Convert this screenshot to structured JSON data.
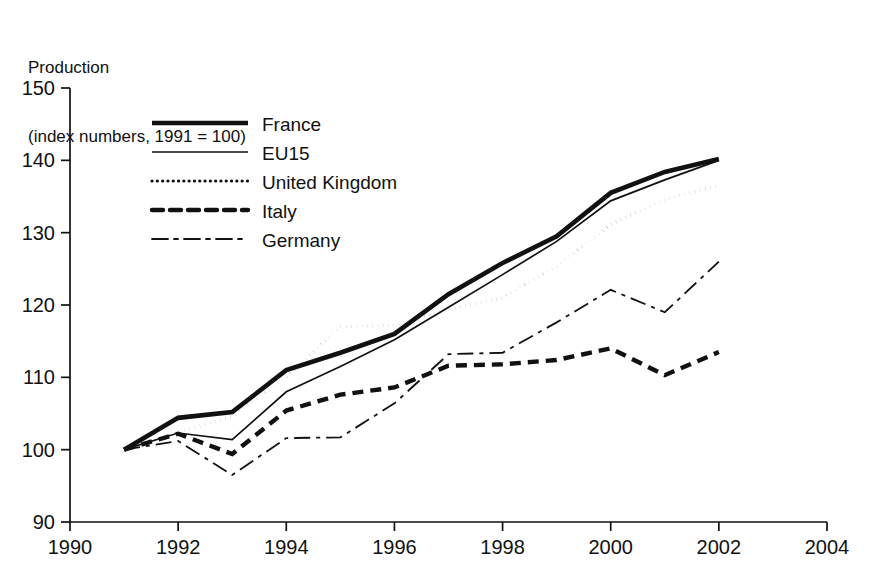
{
  "title": {
    "line1": "Production",
    "line2": "(index numbers, 1991 = 100)"
  },
  "chart_data": {
    "type": "line",
    "title": "Production (index numbers, 1991 = 100)",
    "xlabel": "",
    "ylabel": "Production (index numbers, 1991 = 100)",
    "xlim": [
      1990,
      2004
    ],
    "ylim": [
      90,
      150
    ],
    "xticks": [
      1990,
      1992,
      1994,
      1996,
      1998,
      2000,
      2002,
      2004
    ],
    "yticks": [
      90,
      100,
      110,
      120,
      130,
      140,
      150
    ],
    "xtick_labels": [
      "1990",
      "1992",
      "1994",
      "1996",
      "1998",
      "2000",
      "2002",
      "2004"
    ],
    "ytick_labels": [
      "90",
      "100",
      "110",
      "120",
      "130",
      "140",
      "150"
    ],
    "grid": false,
    "legend_position": "upper-left-inside",
    "x": [
      1991,
      1992,
      1993,
      1994,
      1995,
      1996,
      1997,
      1998,
      1999,
      2000,
      2001,
      2002
    ],
    "series": [
      {
        "name": "France",
        "style": "solid-thick",
        "color": "#111111",
        "values": [
          100.0,
          104.4,
          105.2,
          111.0,
          113.4,
          116.0,
          121.5,
          125.8,
          129.5,
          135.5,
          138.4,
          140.2
        ]
      },
      {
        "name": "EU15",
        "style": "solid-thin",
        "color": "#111111",
        "values": [
          100.0,
          102.3,
          101.4,
          108.0,
          111.5,
          115.2,
          119.7,
          124.2,
          128.8,
          134.4,
          137.3,
          140.0
        ]
      },
      {
        "name": "United Kingdom",
        "style": "dotted",
        "color": "#111111",
        "values": [
          100.0,
          102.4,
          104.6,
          110.1,
          117.0,
          117.2,
          119.4,
          121.0,
          125.4,
          131.1,
          134.6,
          136.5
        ]
      },
      {
        "name": "Italy",
        "style": "dashed-thick",
        "color": "#111111",
        "values": [
          100.0,
          102.2,
          99.4,
          105.4,
          107.6,
          108.6,
          111.6,
          111.8,
          112.4,
          114.0,
          110.3,
          113.5
        ]
      },
      {
        "name": "Germany",
        "style": "dash-dot",
        "color": "#111111",
        "values": [
          100.0,
          101.2,
          96.5,
          101.6,
          101.7,
          106.4,
          113.2,
          113.4,
          117.6,
          122.1,
          119.0,
          126.0
        ]
      }
    ]
  },
  "legend": {
    "items": [
      {
        "label": "France"
      },
      {
        "label": "EU15"
      },
      {
        "label": "United Kingdom"
      },
      {
        "label": "Italy"
      },
      {
        "label": "Germany"
      }
    ]
  }
}
